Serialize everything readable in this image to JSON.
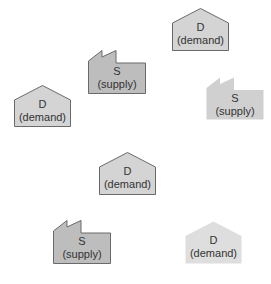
{
  "diagram": {
    "colors": {
      "demand_fill": "#d4d4d4",
      "demand_fill_light": "#dedede",
      "supply_fill": "#bdbdbd",
      "supply_fill_light": "#d0d0d0",
      "stroke": "#6a6a6a",
      "text": "#333333"
    },
    "nodes": [
      {
        "id": "demand-1",
        "type": "demand",
        "icon": "house-icon",
        "letter": "D",
        "caption": "(demand)",
        "x": 172,
        "y": 8,
        "w": 57,
        "h": 43,
        "style": "outlined"
      },
      {
        "id": "supply-1",
        "type": "supply",
        "icon": "factory-icon",
        "letter": "S",
        "caption": "(supply)",
        "x": 88,
        "y": 50,
        "w": 58,
        "h": 44,
        "style": "outlined"
      },
      {
        "id": "demand-2",
        "type": "demand",
        "icon": "house-icon",
        "letter": "D",
        "caption": "(demand)",
        "x": 14,
        "y": 85,
        "w": 57,
        "h": 42,
        "style": "outlined"
      },
      {
        "id": "supply-2",
        "type": "supply",
        "icon": "factory-icon",
        "letter": "S",
        "caption": "(supply)",
        "x": 206,
        "y": 77,
        "w": 58,
        "h": 43,
        "style": "faded"
      },
      {
        "id": "demand-3",
        "type": "demand",
        "icon": "house-icon",
        "letter": "D",
        "caption": "(demand)",
        "x": 99,
        "y": 152,
        "w": 57,
        "h": 43,
        "style": "outlined"
      },
      {
        "id": "supply-3",
        "type": "supply",
        "icon": "factory-icon",
        "letter": "S",
        "caption": "(supply)",
        "x": 53,
        "y": 220,
        "w": 58,
        "h": 44,
        "style": "outlined"
      },
      {
        "id": "demand-4",
        "type": "demand",
        "icon": "house-icon",
        "letter": "D",
        "caption": "(demand)",
        "x": 185,
        "y": 221,
        "w": 57,
        "h": 43,
        "style": "faded"
      }
    ]
  }
}
